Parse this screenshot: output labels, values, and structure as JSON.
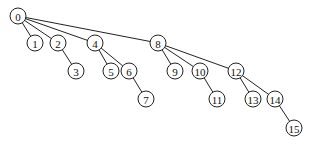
{
  "diagram": {
    "type": "tree",
    "node_radius": 8,
    "nodes": [
      {
        "id": "0",
        "label": "0",
        "x": 18,
        "y": 16
      },
      {
        "id": "1",
        "label": "1",
        "x": 35,
        "y": 43
      },
      {
        "id": "2",
        "label": "2",
        "x": 58,
        "y": 43
      },
      {
        "id": "3",
        "label": "3",
        "x": 76,
        "y": 71
      },
      {
        "id": "4",
        "label": "4",
        "x": 95,
        "y": 43
      },
      {
        "id": "5",
        "label": "5",
        "x": 111,
        "y": 71
      },
      {
        "id": "6",
        "label": "6",
        "x": 129,
        "y": 71
      },
      {
        "id": "7",
        "label": "7",
        "x": 146,
        "y": 99
      },
      {
        "id": "8",
        "label": "8",
        "x": 158,
        "y": 43
      },
      {
        "id": "9",
        "label": "9",
        "x": 175,
        "y": 71
      },
      {
        "id": "10",
        "label": "10",
        "x": 200,
        "y": 71
      },
      {
        "id": "11",
        "label": "11",
        "x": 217,
        "y": 99
      },
      {
        "id": "12",
        "label": "12",
        "x": 236,
        "y": 71
      },
      {
        "id": "13",
        "label": "13",
        "x": 253,
        "y": 99
      },
      {
        "id": "14",
        "label": "14",
        "x": 275,
        "y": 99
      },
      {
        "id": "15",
        "label": "15",
        "x": 294,
        "y": 128
      }
    ],
    "edges": [
      [
        "0",
        "1"
      ],
      [
        "0",
        "2"
      ],
      [
        "0",
        "4"
      ],
      [
        "0",
        "8"
      ],
      [
        "2",
        "3"
      ],
      [
        "4",
        "5"
      ],
      [
        "4",
        "6"
      ],
      [
        "6",
        "7"
      ],
      [
        "8",
        "9"
      ],
      [
        "8",
        "10"
      ],
      [
        "8",
        "12"
      ],
      [
        "10",
        "11"
      ],
      [
        "12",
        "13"
      ],
      [
        "12",
        "14"
      ],
      [
        "14",
        "15"
      ]
    ]
  }
}
